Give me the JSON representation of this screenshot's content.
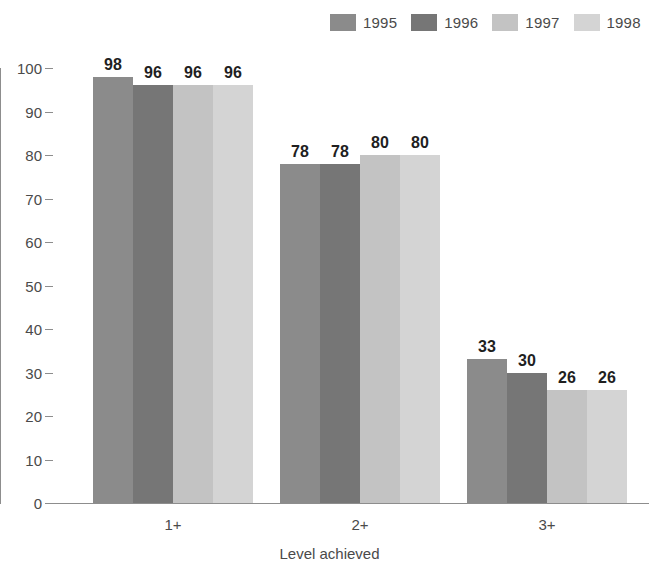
{
  "chart_data": {
    "type": "bar",
    "title": "",
    "subtitle": "",
    "xlabel": "Level achieved",
    "ylabel": "",
    "categories": [
      "1+",
      "2+",
      "3+"
    ],
    "series": [
      {
        "name": "1995",
        "color": "#8b8b8b",
        "values": [
          98,
          78,
          33
        ]
      },
      {
        "name": "1996",
        "color": "#767676",
        "values": [
          96,
          78,
          30
        ]
      },
      {
        "name": "1997",
        "color": "#c3c3c3",
        "values": [
          96,
          80,
          26
        ]
      },
      {
        "name": "1998",
        "color": "#d4d4d4",
        "values": [
          96,
          80,
          26
        ]
      }
    ],
    "ylim": [
      0,
      100
    ],
    "yticks": [
      0,
      10,
      20,
      30,
      40,
      50,
      60,
      70,
      80,
      90,
      100
    ],
    "ytick_labels": [
      "0",
      "10",
      "20",
      "30",
      "40",
      "50",
      "60",
      "70",
      "80",
      "90",
      "100"
    ],
    "grid": false,
    "legend_position": "top-right",
    "bar_value_labels": [
      [
        "98",
        "96",
        "96",
        "96"
      ],
      [
        "78",
        "78",
        "80",
        "80"
      ],
      [
        "33",
        "30",
        "26",
        "26"
      ]
    ],
    "axis_color": "#8d8d8d",
    "text_color": "#4a4a4a",
    "value_label_color": "#1f1f1f"
  },
  "legend": {
    "items": [
      {
        "label": "1995"
      },
      {
        "label": "1996"
      },
      {
        "label": "1997"
      },
      {
        "label": "1998"
      }
    ]
  },
  "axes": {
    "x_title": "Level achieved"
  }
}
